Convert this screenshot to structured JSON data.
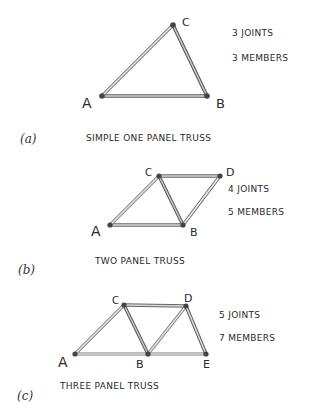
{
  "figures": [
    {
      "label": "(a)",
      "title": "SIMPLE ONE PANEL TRUSS",
      "joints_text": "3 JOINTS",
      "members_text": "3 MEMBERS",
      "nodes": {
        "A": {
          "x": 102,
          "y": 96
        },
        "B": {
          "x": 207,
          "y": 96
        },
        "C": {
          "x": 173,
          "y": 25
        }
      },
      "members": [
        [
          "A",
          "B"
        ],
        [
          "A",
          "C"
        ],
        [
          "C",
          "B"
        ]
      ]
    },
    {
      "label": "(b)",
      "title": "TWO PANEL TRUSS",
      "joints_text": "4 JOINTS",
      "members_text": "5 MEMBERS",
      "nodes": {
        "A": {
          "x": 110,
          "y": 225
        },
        "B": {
          "x": 183,
          "y": 225
        },
        "C": {
          "x": 159,
          "y": 176
        },
        "D": {
          "x": 220,
          "y": 176
        }
      },
      "members": [
        [
          "A",
          "B"
        ],
        [
          "A",
          "C"
        ],
        [
          "C",
          "B"
        ],
        [
          "C",
          "D"
        ],
        [
          "D",
          "B"
        ]
      ]
    },
    {
      "label": "(c)",
      "title": "THREE PANEL TRUSS",
      "joints_text": "5 JOINTS",
      "members_text": "7 MEMBERS",
      "nodes": {
        "A": {
          "x": 75,
          "y": 354
        },
        "B": {
          "x": 148,
          "y": 354
        },
        "C": {
          "x": 124,
          "y": 305
        },
        "D": {
          "x": 186,
          "y": 306
        },
        "E": {
          "x": 206,
          "y": 354
        }
      },
      "members": [
        [
          "A",
          "B"
        ],
        [
          "B",
          "E"
        ],
        [
          "A",
          "C"
        ],
        [
          "C",
          "B"
        ],
        [
          "C",
          "D"
        ],
        [
          "B",
          "D"
        ],
        [
          "D",
          "E"
        ]
      ]
    }
  ],
  "colors": {
    "member_outline": "#555555",
    "member_fill": "#d8d8d8",
    "joint": "#444444",
    "text": "#2a2a2a"
  }
}
